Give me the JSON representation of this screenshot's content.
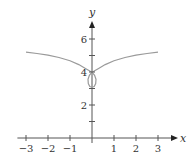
{
  "chart_data": {
    "type": "line",
    "title": "",
    "xlabel": "x",
    "ylabel": "y",
    "xlim": [
      -3.3,
      3.7
    ],
    "ylim": [
      -0.3,
      7.8
    ],
    "xticks": [
      -3,
      -2,
      -1,
      1,
      2,
      3
    ],
    "xtick_labels": [
      "−3",
      "−2",
      "−1",
      "1",
      "2",
      "3"
    ],
    "yticks": [
      1,
      2,
      3,
      4,
      5,
      6
    ],
    "ytick_labels": [
      "",
      "2",
      "",
      "4",
      "",
      "6"
    ],
    "grid": false,
    "series": [
      {
        "name": "parametric curve",
        "color": "#9a9a9a",
        "points": [
          [
            -3,
            5.2
          ],
          [
            -2.5,
            5.12
          ],
          [
            -2,
            5.02
          ],
          [
            -1.5,
            4.88
          ],
          [
            -1,
            4.68
          ],
          [
            -0.6,
            4.45
          ],
          [
            -0.3,
            4.22
          ],
          [
            -0.1,
            4.06
          ],
          [
            0,
            4.0
          ],
          [
            -0.12,
            3.8
          ],
          [
            -0.18,
            3.55
          ],
          [
            -0.17,
            3.3
          ],
          [
            -0.1,
            3.12
          ],
          [
            0,
            3.08
          ],
          [
            0.1,
            3.12
          ],
          [
            0.17,
            3.3
          ],
          [
            0.18,
            3.55
          ],
          [
            0.12,
            3.8
          ],
          [
            0,
            4.0
          ],
          [
            0.1,
            4.06
          ],
          [
            0.3,
            4.22
          ],
          [
            0.6,
            4.45
          ],
          [
            1,
            4.68
          ],
          [
            1.5,
            4.88
          ],
          [
            2,
            5.02
          ],
          [
            2.5,
            5.12
          ],
          [
            3,
            5.2
          ]
        ]
      }
    ]
  }
}
